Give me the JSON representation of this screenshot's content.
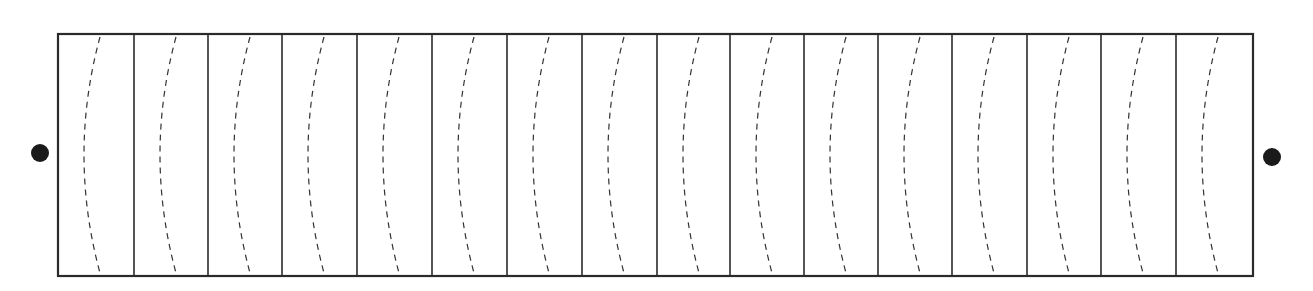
{
  "diagram": {
    "title": "",
    "frame": {
      "x": 58,
      "y": 34,
      "width": 1195,
      "height": 242,
      "stroke": "#2a2a2a"
    },
    "dividers_x": [
      58,
      134,
      208,
      282,
      357,
      432,
      507,
      582,
      657,
      730,
      804,
      878,
      952,
      1027,
      1101,
      1176,
      1253
    ],
    "panel_count": 16,
    "curve": {
      "top_offset": 42,
      "mid_offset": 26,
      "stroke": "#333333",
      "dash": "6,5"
    },
    "terminals": [
      {
        "name": "left-terminal",
        "cx": 40,
        "cy": 153,
        "r": 9,
        "fill": "#1a1a1a"
      },
      {
        "name": "right-terminal",
        "cx": 1272,
        "cy": 157,
        "r": 9,
        "fill": "#1a1a1a"
      }
    ]
  }
}
